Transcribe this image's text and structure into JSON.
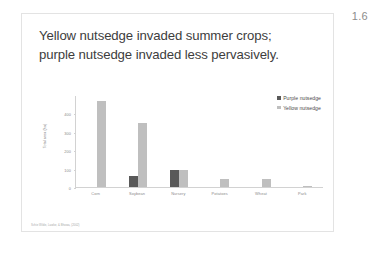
{
  "slide": {
    "page_number": "1.6",
    "title": "Yellow nutsedge invaded summer crops; purple nutsedge invaded less pervasively.",
    "citation": "Schie Wilde, Lawlor, & Bhowa, (2002)"
  },
  "chart_data": {
    "type": "bar",
    "title": "",
    "xlabel": "",
    "ylabel": "Total area (ha)",
    "ylim": [
      0,
      500
    ],
    "yticks": [
      0,
      100,
      200,
      300,
      400
    ],
    "ytick_labels": [
      "0",
      "100",
      "200",
      "300",
      "400"
    ],
    "grid": false,
    "legend_position": "top-right",
    "categories": [
      "Corn",
      "Soybean",
      "Nursery",
      "Potatoes",
      "Wheat",
      "Park"
    ],
    "series": [
      {
        "name": "Purple nutsedge",
        "color": "#595959",
        "values": [
          0,
          60,
          95,
          0,
          0,
          0
        ]
      },
      {
        "name": "Yellow nutsedge",
        "color": "#bfbfbf",
        "values": [
          470,
          350,
          95,
          45,
          45,
          5
        ]
      }
    ]
  }
}
